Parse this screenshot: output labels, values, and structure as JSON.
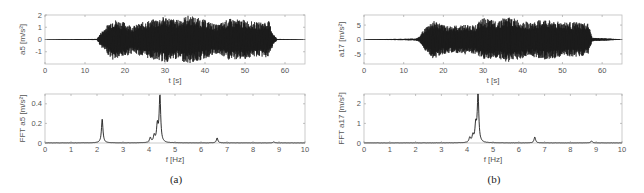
{
  "panels": [
    {
      "label": "(a)",
      "bold_letter": "a"
    },
    {
      "label": "(b)",
      "bold_letter": "b"
    }
  ],
  "chart_data": [
    {
      "id": "a-time",
      "type": "line",
      "panel": "(a)",
      "title": "",
      "xlabel": "t [s]",
      "ylabel": "a5 [m/s²]",
      "xlim": [
        0,
        65
      ],
      "ylim": [
        -2,
        2
      ],
      "xticks": [
        0,
        10,
        20,
        30,
        40,
        50,
        60
      ],
      "yticks": [
        -1,
        0,
        1,
        2
      ],
      "grid": false,
      "description": "Acceleration time history; near zero 0–13 s, dense oscillation ±1–2 m/s² from ~14 s to ~57 s, near zero after",
      "envelope": {
        "t": [
          0,
          13,
          14,
          17,
          20,
          22,
          25,
          28,
          30,
          33,
          36,
          40,
          43,
          46,
          50,
          53,
          56,
          57,
          58,
          65
        ],
        "amp": [
          0.02,
          0.05,
          0.6,
          1.7,
          1.4,
          1.1,
          1.5,
          1.7,
          1.9,
          1.6,
          2.0,
          1.6,
          1.2,
          1.7,
          1.6,
          1.4,
          1.5,
          0.5,
          0.05,
          0.02
        ]
      }
    },
    {
      "id": "a-fft",
      "type": "line",
      "panel": "(a)",
      "xlabel": "f [Hz]",
      "ylabel": "FFT a5 [m/s²]",
      "xlim": [
        0,
        10
      ],
      "ylim": [
        0,
        0.5
      ],
      "xticks": [
        0,
        1,
        2,
        3,
        4,
        5,
        6,
        7,
        8,
        9,
        10
      ],
      "yticks": [
        0,
        0.2,
        0.4
      ],
      "grid": false,
      "peaks": [
        {
          "f": 2.2,
          "amp": 0.24
        },
        {
          "f": 4.05,
          "amp": 0.05
        },
        {
          "f": 4.2,
          "amp": 0.07
        },
        {
          "f": 4.32,
          "amp": 0.17
        },
        {
          "f": 4.42,
          "amp": 0.48
        },
        {
          "f": 6.62,
          "amp": 0.05
        },
        {
          "f": 8.8,
          "amp": 0.01
        }
      ]
    },
    {
      "id": "b-time",
      "type": "line",
      "panel": "(b)",
      "xlabel": "t [s]",
      "ylabel": "a17 [m/s²]",
      "xlim": [
        0,
        65
      ],
      "ylim": [
        -8.5,
        8.5
      ],
      "xticks": [
        0,
        10,
        20,
        30,
        40,
        50,
        60
      ],
      "yticks": [
        -5,
        0,
        5
      ],
      "grid": false,
      "description": "Acceleration time history; dense oscillation ±5–8 m/s² from ~14 s to ~57 s",
      "envelope": {
        "t": [
          0,
          13,
          14,
          15,
          17.5,
          20,
          23,
          25,
          28,
          30,
          33,
          36,
          40,
          42,
          45,
          50,
          54,
          56.5,
          57.5,
          65
        ],
        "amp": [
          0.1,
          0.3,
          1.0,
          3.5,
          6.8,
          5.0,
          4.8,
          5.2,
          5.0,
          7.5,
          6.5,
          8.0,
          6.5,
          5.8,
          7.0,
          6.2,
          6.0,
          5.5,
          0.6,
          0.1
        ]
      }
    },
    {
      "id": "b-fft",
      "type": "line",
      "panel": "(b)",
      "xlabel": "f [Hz]",
      "ylabel": "FFT a17 [m/s²]",
      "xlim": [
        0,
        10
      ],
      "ylim": [
        0,
        2.5
      ],
      "xticks": [
        0,
        1,
        2,
        3,
        4,
        5,
        6,
        7,
        8,
        9,
        10
      ],
      "yticks": [
        0,
        1,
        2
      ],
      "grid": false,
      "peaks": [
        {
          "f": 4.1,
          "amp": 0.25
        },
        {
          "f": 4.22,
          "amp": 0.35
        },
        {
          "f": 4.33,
          "amp": 0.85
        },
        {
          "f": 4.42,
          "amp": 2.5
        },
        {
          "f": 6.62,
          "amp": 0.3
        },
        {
          "f": 8.82,
          "amp": 0.1
        }
      ]
    }
  ]
}
